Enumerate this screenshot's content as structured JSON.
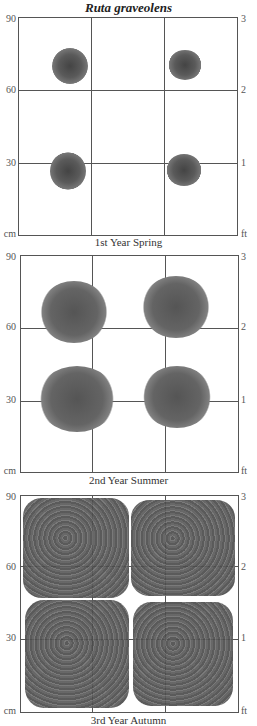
{
  "title": "Ruta graveolens",
  "units": {
    "left": "cm",
    "right": "ft"
  },
  "axis": {
    "left_ticks": [
      "90",
      "60",
      "30"
    ],
    "right_ticks": [
      "3",
      "2",
      "1"
    ]
  },
  "panels": [
    {
      "caption": "1st Year Spring",
      "plant_size": "small"
    },
    {
      "caption": "2nd Year Summer",
      "plant_size": "medium"
    },
    {
      "caption": "3rd Year Autumn",
      "plant_size": "large"
    }
  ],
  "colors": {
    "grid": "#555555",
    "foliage": "#5a5a5a",
    "background": "#ffffff"
  }
}
